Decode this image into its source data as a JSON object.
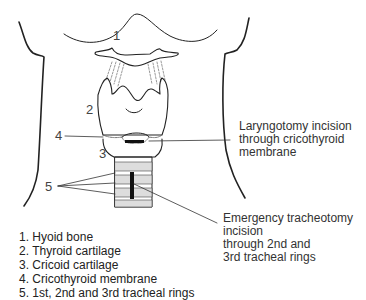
{
  "diagram": {
    "numbers": {
      "n1": "1",
      "n2": "2",
      "n3": "3",
      "n4": "4",
      "n5": "5"
    },
    "annotations": {
      "laryngotomy": [
        "Laryngotomy incision",
        "through cricothyroid",
        "membrane"
      ],
      "tracheotomy": [
        "Emergency tracheotomy",
        "incision",
        "through 2nd and",
        "3rd tracheal rings"
      ]
    },
    "legend": [
      "1. Hyoid bone",
      "2. Thyroid cartilage",
      "3. Cricoid cartilage",
      "4. Cricothyroid membrane",
      "5. 1st, 2nd and 3rd tracheal rings"
    ]
  }
}
